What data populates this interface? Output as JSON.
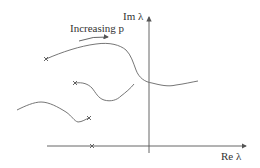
{
  "diagram": {
    "type": "root-locus-sketch",
    "labels": {
      "im_axis": "Im λ",
      "re_axis": "Re λ",
      "annotation": "Increasing p"
    },
    "axes": {
      "vertical": {
        "x": 149,
        "y_top": 17,
        "y_bottom": 153,
        "arrow": true
      },
      "horizontal": {
        "y": 146,
        "x_left": 47,
        "x_right": 246,
        "arrow": true
      }
    },
    "curves": [
      {
        "name": "upper-branch",
        "start_marker": [
          46,
          59
        ]
      },
      {
        "name": "middle-branch",
        "start_marker": [
          75,
          83
        ]
      },
      {
        "name": "lower-branch",
        "end_marker": [
          89,
          118
        ]
      }
    ],
    "real_axis_marker": [
      92,
      146
    ],
    "colors": {
      "stroke": "#555555",
      "text": "#333333",
      "background": "#ffffff"
    }
  }
}
